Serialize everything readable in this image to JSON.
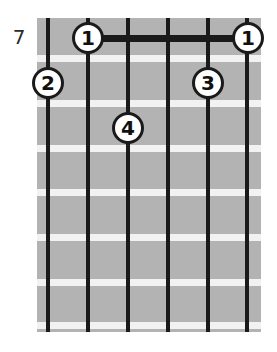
{
  "diagram": {
    "type": "guitar-chord-diagram",
    "fret_position_label": "7",
    "string_count": 6,
    "fret_count": 7,
    "colors": {
      "fretboard": "#b3b3b3",
      "fret_line": "#f2f2f2",
      "string": "#1a1a1a",
      "marker_fill": "#ffffff",
      "marker_stroke": "#1a1a1a",
      "marker_text": "#111111",
      "background": "#ffffff",
      "label_text": "#2b2b2b"
    },
    "geometry": {
      "board_left": 37,
      "board_top": 18,
      "board_width": 224,
      "board_height": 314,
      "string_x": [
        48,
        88,
        128,
        168,
        208,
        247
      ],
      "fret_y": [
        58,
        103,
        148,
        192,
        237,
        282,
        325
      ]
    },
    "barre": {
      "label": "1",
      "from_string_x": 88,
      "to_string_x": 248,
      "y": 38,
      "fret": 1
    },
    "markers": [
      {
        "label": "1",
        "x": 88,
        "y": 38,
        "string": 2,
        "fret": 1
      },
      {
        "label": "1",
        "x": 248,
        "y": 38,
        "string": 6,
        "fret": 1
      },
      {
        "label": "2",
        "x": 48,
        "y": 83,
        "string": 1,
        "fret": 2
      },
      {
        "label": "3",
        "x": 208,
        "y": 83,
        "string": 5,
        "fret": 2
      },
      {
        "label": "4",
        "x": 128,
        "y": 128,
        "string": 3,
        "fret": 3
      }
    ]
  }
}
